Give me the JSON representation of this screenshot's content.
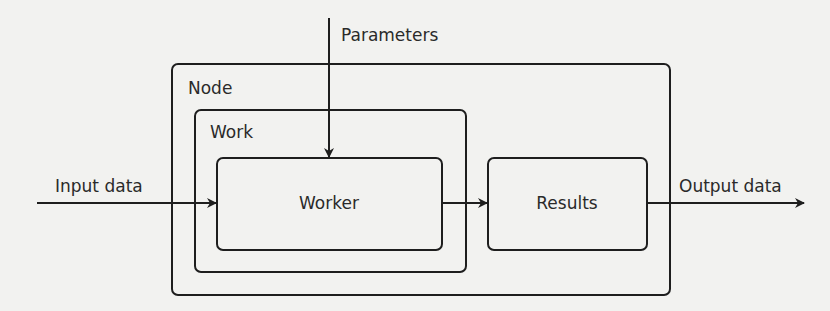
{
  "diagram": {
    "inputs": {
      "parameters": "Parameters",
      "input_data": "Input data"
    },
    "outputs": {
      "output_data": "Output data"
    },
    "containers": {
      "node": "Node",
      "work": "Work"
    },
    "boxes": {
      "worker": "Worker",
      "results": "Results"
    },
    "edges": [
      {
        "from": "Parameters",
        "to": "Worker"
      },
      {
        "from": "Input data",
        "to": "Worker"
      },
      {
        "from": "Worker",
        "to": "Results"
      },
      {
        "from": "Results",
        "to": "Output data"
      }
    ],
    "colors": {
      "stroke": "#1e1e1e",
      "background": "#f2f2f0",
      "text": "#2a2a2a"
    }
  }
}
